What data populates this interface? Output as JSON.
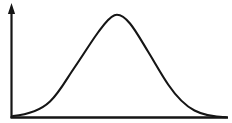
{
  "figure": {
    "width": 232,
    "height": 123,
    "background_color": "#FFFFFF",
    "ink_color": "#151515",
    "title": "",
    "caption": ""
  },
  "axes": {
    "y_axis": {
      "name": "y-axis",
      "label": "",
      "x": 11.5,
      "y_top": 13,
      "y_bottom": 118,
      "stroke_width": 2.2,
      "has_arrowhead": true,
      "arrowhead": {
        "tip_x": 11.5,
        "tip_y": 3,
        "half_width": 3.6,
        "base_y": 14
      }
    },
    "x_axis": {
      "name": "x-axis",
      "label": "",
      "y": 117.5,
      "x_left": 10.5,
      "x_right": 228,
      "stroke_width": 2.4,
      "has_arrowhead": false
    },
    "tick_labels_x": [],
    "tick_labels_y": [],
    "grid": false
  },
  "chart_data": {
    "type": "line",
    "title": "",
    "subtitle": "",
    "xlabel": "",
    "ylabel": "",
    "legend": [],
    "legend_position": "none",
    "grid": false,
    "annotations": [],
    "xlim": [
      0,
      232
    ],
    "ylim": [
      0,
      123
    ],
    "series": [
      {
        "name": "bell-curve",
        "kind": "gaussian",
        "color": "#151515",
        "stroke_width": 2.1,
        "peak": {
          "x": 114,
          "y": 15
        },
        "baseline_y": 117,
        "start": {
          "x": 13,
          "y": 116
        },
        "end": {
          "x": 226,
          "y": 117
        },
        "points": [
          {
            "x": 13,
            "y": 116
          },
          {
            "x": 24,
            "y": 114
          },
          {
            "x": 34,
            "y": 111
          },
          {
            "x": 43,
            "y": 106
          },
          {
            "x": 52,
            "y": 99
          },
          {
            "x": 60,
            "y": 90
          },
          {
            "x": 68,
            "y": 79
          },
          {
            "x": 76,
            "y": 66
          },
          {
            "x": 84,
            "y": 53
          },
          {
            "x": 92,
            "y": 41
          },
          {
            "x": 99,
            "y": 31
          },
          {
            "x": 105,
            "y": 23
          },
          {
            "x": 110,
            "y": 18
          },
          {
            "x": 114,
            "y": 15
          },
          {
            "x": 119,
            "y": 15
          },
          {
            "x": 124,
            "y": 17
          },
          {
            "x": 130,
            "y": 22
          },
          {
            "x": 136,
            "y": 30
          },
          {
            "x": 143,
            "y": 41
          },
          {
            "x": 150,
            "y": 53
          },
          {
            "x": 157,
            "y": 66
          },
          {
            "x": 165,
            "y": 79
          },
          {
            "x": 173,
            "y": 90
          },
          {
            "x": 181,
            "y": 99
          },
          {
            "x": 190,
            "y": 106
          },
          {
            "x": 199,
            "y": 111
          },
          {
            "x": 210,
            "y": 115
          },
          {
            "x": 226,
            "y": 117
          }
        ],
        "path": "M 13 116 C 28 114.5 40.5 110.5 50 101.5 C 59.5 92.5 66.5 79 74.5 67.5 C 82.5 56 90 43.5 98 32.5 C 104 24.5 108.5 17.5 114.5 15.2 C 120 13.3 125 17.5 130 23.5 C 136 30.8 141.5 41 148 51.5 C 154.5 62 161 74 168.5 85 C 176 96 184 105 194.5 110.5 C 205 116 216 117 226 117.3"
      }
    ]
  }
}
